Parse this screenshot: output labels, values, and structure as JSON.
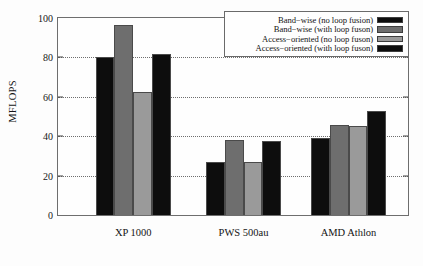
{
  "chart_data": {
    "type": "bar",
    "title": "",
    "xlabel": "",
    "ylabel": "MFLOPS",
    "ylim": [
      0,
      100
    ],
    "yticks": [
      0,
      20,
      40,
      60,
      80,
      100
    ],
    "ytick_labels": [
      "0",
      "20",
      "40",
      "60",
      "80",
      "100"
    ],
    "grid": true,
    "grid_axis": "y",
    "legend_position": "top-right",
    "categories": [
      "XP 1000",
      "PWS 500au",
      "AMD Athlon"
    ],
    "series": [
      {
        "name": "Band-wise (no loop fusion)",
        "color": "#0d0d0d",
        "values": [
          80,
          27,
          39
        ]
      },
      {
        "name": "Band-wise (with loop fuson)",
        "color": "#6e6e6e",
        "values": [
          96.5,
          38,
          45.5
        ]
      },
      {
        "name": "Access-oriented (no loop fuson)",
        "color": "#9a9a9a",
        "values": [
          62.5,
          27,
          45
        ]
      },
      {
        "name": "Access-oriented (with loop fuson)",
        "color": "#0d0d0d",
        "values": [
          81.5,
          37.5,
          53
        ]
      }
    ]
  },
  "legend": {
    "entries": [
      {
        "label": "Band−wise (no loop fusion)",
        "swatch": "#0d0d0d"
      },
      {
        "label": "Band−wise (with loop fuson)",
        "swatch": "#6e6e6e"
      },
      {
        "label": "Access−oriented (no loop fuson)",
        "swatch": "#9a9a9a"
      },
      {
        "label": "Access−oriented (with loop fuson)",
        "swatch": "#0d0d0d"
      }
    ]
  },
  "axes": {
    "y_label": "MFLOPS",
    "y_ticks": [
      "0",
      "20",
      "40",
      "60",
      "80",
      "100"
    ],
    "x_labels": [
      "XP 1000",
      "PWS 500au",
      "AMD Athlon"
    ]
  }
}
